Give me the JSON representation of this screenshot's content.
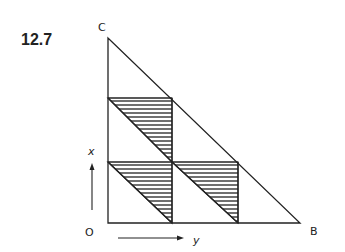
{
  "figure": {
    "number": "12.7",
    "vertices": {
      "C": "C",
      "O": "O",
      "B": "B"
    },
    "axes": {
      "vertical_label": "x",
      "horizontal_label": "y"
    }
  },
  "colors": {
    "line": "#222222",
    "background": "#ffffff"
  }
}
